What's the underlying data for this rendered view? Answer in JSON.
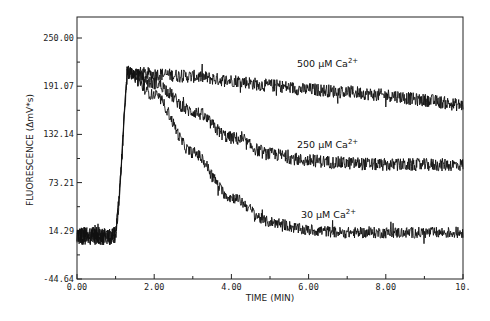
{
  "chart_data": {
    "type": "line",
    "title": "",
    "xlabel": "TIME (MIN)",
    "ylabel": "FLUORESCENCE (ΔmV*s)",
    "xlim": [
      0,
      10
    ],
    "ylim": [
      -44.64,
      250.0
    ],
    "grid": false,
    "legend": "none (inline annotations)",
    "x_ticks": [
      "0.00",
      "2.00",
      "4.00",
      "6.00",
      "8.00",
      "10."
    ],
    "x_minor_ticks": [
      1,
      3,
      5,
      7,
      9
    ],
    "y_ticks": [
      "250.00",
      "191.07",
      "132.14",
      "73.21",
      "14.29",
      "-44.64"
    ],
    "y_tick_values": [
      250.0,
      191.07,
      132.14,
      73.21,
      14.29,
      -44.64
    ],
    "stimulus_time_min": 1.1,
    "baseline_value": 8,
    "series": [
      {
        "name": "500 µM Ca2+",
        "annotation": "500 µM Ca",
        "annotation_sup": "2+",
        "x": [
          0,
          1.0,
          1.1,
          1.3,
          2.0,
          3.0,
          4.0,
          5.0,
          6.0,
          7.0,
          8.0,
          9.0,
          10.0
        ],
        "values": [
          8,
          8,
          60,
          208,
          206,
          203,
          198,
          192,
          187,
          184,
          180,
          174,
          168
        ],
        "noise_amplitude": 8
      },
      {
        "name": "250 µM Ca2+",
        "annotation": "250 µM Ca",
        "annotation_sup": "2+",
        "x": [
          0,
          1.0,
          1.1,
          1.3,
          2.0,
          3.0,
          4.0,
          5.0,
          6.0,
          7.0,
          8.0,
          9.0,
          10.0
        ],
        "values": [
          8,
          8,
          60,
          208,
          195,
          160,
          128,
          108,
          100,
          97,
          95,
          95,
          95
        ],
        "noise_amplitude": 8
      },
      {
        "name": "30 µM Ca2+",
        "annotation": "30 µM Ca",
        "annotation_sup": "2+",
        "x": [
          0,
          1.0,
          1.1,
          1.3,
          2.0,
          3.0,
          4.0,
          5.0,
          6.0,
          7.0,
          8.0,
          9.0,
          10.0
        ],
        "values": [
          8,
          8,
          60,
          208,
          180,
          110,
          55,
          25,
          15,
          12,
          12,
          12,
          12
        ],
        "noise_amplitude": 7
      }
    ],
    "annotations": [
      {
        "text": "500 µM Ca2+",
        "x": 5.7,
        "y": 214
      },
      {
        "text": "250 µM Ca2+",
        "x": 5.7,
        "y": 116
      },
      {
        "text": "30 µM Ca2+",
        "x": 5.8,
        "y": 30
      }
    ],
    "colors": {
      "line": "#111111",
      "axis": "#222222",
      "background": "#ffffff"
    }
  }
}
